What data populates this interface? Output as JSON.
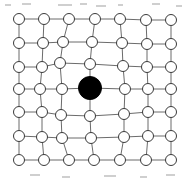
{
  "figure": {
    "name": "lattice-defect-diagram",
    "type": "diagram",
    "background_color": "#ffffff",
    "width": 195,
    "height": 180
  },
  "style": {
    "bond_color": "#6b6b6b",
    "bond_width": 1,
    "host_atom_fill": "#ffffff",
    "host_atom_stroke": "#3a3a3a",
    "host_atom_radius": 5.5,
    "defect_atom_fill": "#000000",
    "defect_atom_radius": 11.5
  },
  "lattice": {
    "rows": 7,
    "columns": 7,
    "host_atom_count": 48,
    "defect_atom_count": 1,
    "defect_row_index": 3,
    "defect_column_index": 3,
    "nodes": [
      [
        {
          "x": 19,
          "y": 19,
          "kind": "host"
        },
        {
          "x": 44,
          "y": 19,
          "kind": "host"
        },
        {
          "x": 69,
          "y": 19,
          "kind": "host"
        },
        {
          "x": 95,
          "y": 19,
          "kind": "host"
        },
        {
          "x": 120,
          "y": 19,
          "kind": "host"
        },
        {
          "x": 146,
          "y": 20,
          "kind": "host"
        },
        {
          "x": 171,
          "y": 20,
          "kind": "host"
        }
      ],
      [
        {
          "x": 19,
          "y": 43,
          "kind": "host"
        },
        {
          "x": 43,
          "y": 43,
          "kind": "host"
        },
        {
          "x": 63,
          "y": 42,
          "kind": "host"
        },
        {
          "x": 92,
          "y": 42,
          "kind": "host"
        },
        {
          "x": 122,
          "y": 43,
          "kind": "host"
        },
        {
          "x": 147,
          "y": 44,
          "kind": "host"
        },
        {
          "x": 171,
          "y": 44,
          "kind": "host"
        }
      ],
      [
        {
          "x": 19,
          "y": 67,
          "kind": "host"
        },
        {
          "x": 42,
          "y": 67,
          "kind": "host"
        },
        {
          "x": 60,
          "y": 63,
          "kind": "host"
        },
        {
          "x": 90,
          "y": 64,
          "kind": "host"
        },
        {
          "x": 123,
          "y": 66,
          "kind": "host"
        },
        {
          "x": 147,
          "y": 67,
          "kind": "host"
        },
        {
          "x": 171,
          "y": 67,
          "kind": "host"
        }
      ],
      [
        {
          "x": 19,
          "y": 89,
          "kind": "host"
        },
        {
          "x": 40,
          "y": 89,
          "kind": "host"
        },
        {
          "x": 62,
          "y": 89,
          "kind": "host"
        },
        {
          "x": 90,
          "y": 88,
          "kind": "defect"
        },
        {
          "x": 125,
          "y": 89,
          "kind": "host"
        },
        {
          "x": 148,
          "y": 89,
          "kind": "host"
        },
        {
          "x": 171,
          "y": 89,
          "kind": "host"
        }
      ],
      [
        {
          "x": 19,
          "y": 112,
          "kind": "host"
        },
        {
          "x": 42,
          "y": 112,
          "kind": "host"
        },
        {
          "x": 61,
          "y": 115,
          "kind": "host"
        },
        {
          "x": 90,
          "y": 116,
          "kind": "host"
        },
        {
          "x": 124,
          "y": 114,
          "kind": "host"
        },
        {
          "x": 148,
          "y": 112,
          "kind": "host"
        },
        {
          "x": 171,
          "y": 112,
          "kind": "host"
        }
      ],
      [
        {
          "x": 19,
          "y": 136,
          "kind": "host"
        },
        {
          "x": 42,
          "y": 137,
          "kind": "host"
        },
        {
          "x": 62,
          "y": 138,
          "kind": "host"
        },
        {
          "x": 91,
          "y": 138,
          "kind": "host"
        },
        {
          "x": 124,
          "y": 137,
          "kind": "host"
        },
        {
          "x": 148,
          "y": 136,
          "kind": "host"
        },
        {
          "x": 171,
          "y": 136,
          "kind": "host"
        }
      ],
      [
        {
          "x": 19,
          "y": 160,
          "kind": "host"
        },
        {
          "x": 44,
          "y": 160,
          "kind": "host"
        },
        {
          "x": 69,
          "y": 160,
          "kind": "host"
        },
        {
          "x": 94,
          "y": 160,
          "kind": "host"
        },
        {
          "x": 120,
          "y": 160,
          "kind": "host"
        },
        {
          "x": 146,
          "y": 160,
          "kind": "host"
        },
        {
          "x": 171,
          "y": 160,
          "kind": "host"
        }
      ]
    ],
    "specks": [
      {
        "x": 5,
        "y": 4,
        "w": 6,
        "h": 2
      },
      {
        "x": 22,
        "y": 3,
        "w": 9,
        "h": 2
      },
      {
        "x": 58,
        "y": 4,
        "w": 14,
        "h": 2
      },
      {
        "x": 80,
        "y": 3,
        "w": 7,
        "h": 2
      },
      {
        "x": 96,
        "y": 5,
        "w": 10,
        "h": 2
      },
      {
        "x": 118,
        "y": 4,
        "w": 5,
        "h": 2
      },
      {
        "x": 152,
        "y": 3,
        "w": 8,
        "h": 2
      },
      {
        "x": 176,
        "y": 5,
        "w": 6,
        "h": 2
      },
      {
        "x": 30,
        "y": 174,
        "w": 10,
        "h": 2
      },
      {
        "x": 62,
        "y": 176,
        "w": 8,
        "h": 2
      },
      {
        "x": 104,
        "y": 175,
        "w": 12,
        "h": 2
      },
      {
        "x": 140,
        "y": 176,
        "w": 7,
        "h": 2
      },
      {
        "x": 166,
        "y": 174,
        "w": 9,
        "h": 2
      }
    ]
  }
}
